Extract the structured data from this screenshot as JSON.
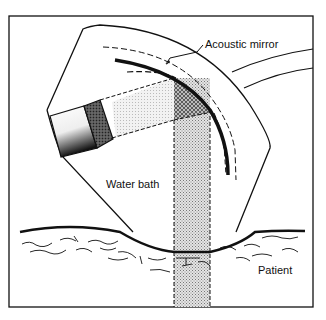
{
  "figure": {
    "labels": {
      "mirror": "Acoustic mirror",
      "water": "Water bath",
      "patient": "Patient"
    },
    "colors": {
      "ink": "#111111",
      "background": "#ffffff",
      "beam_fill": "#c8c8c8"
    }
  }
}
